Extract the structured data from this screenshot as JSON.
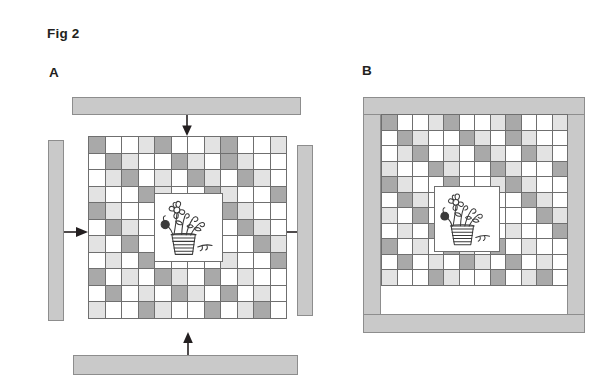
{
  "figure": {
    "title": "Fig 2",
    "panels": [
      {
        "id": "A",
        "label": "A"
      },
      {
        "id": "B",
        "label": "B"
      }
    ]
  },
  "colors": {
    "cell_white": "#ffffff",
    "cell_light": "#e3e3e3",
    "cell_dark": "#a9a9a9",
    "bar_fill": "#c9c9c9",
    "bar_stroke": "#8d8d8d",
    "grid_line": "#6f6f6f",
    "ink": "#231f20"
  },
  "panel_a": {
    "label": "A",
    "grid": {
      "rows": 11,
      "cols": 12,
      "cell_px": 16.5,
      "legend": {
        "w": "white",
        "l": "light-gray",
        "d": "dark-gray"
      },
      "pattern": [
        [
          "d",
          "w",
          "w",
          "l",
          "d",
          "w",
          "w",
          "l",
          "d",
          "w",
          "w",
          "l"
        ],
        [
          "w",
          "d",
          "l",
          "w",
          "w",
          "d",
          "l",
          "w",
          "d",
          "l",
          "w",
          "w"
        ],
        [
          "w",
          "l",
          "d",
          "w",
          "l",
          "w",
          "d",
          "l",
          "w",
          "d",
          "l",
          "w"
        ],
        [
          "l",
          "w",
          "w",
          "d",
          "l",
          "w",
          "w",
          "d",
          "l",
          "w",
          "w",
          "d"
        ],
        [
          "d",
          "l",
          "w",
          "w",
          "d",
          "w",
          "w",
          "l",
          "d",
          "l",
          "w",
          "w"
        ],
        [
          "w",
          "d",
          "l",
          "w",
          "w",
          "w",
          "w",
          "w",
          "w",
          "d",
          "l",
          "w"
        ],
        [
          "l",
          "w",
          "d",
          "w",
          "w",
          "w",
          "w",
          "w",
          "w",
          "w",
          "d",
          "l"
        ],
        [
          "w",
          "l",
          "w",
          "d",
          "w",
          "w",
          "w",
          "w",
          "l",
          "w",
          "w",
          "d"
        ],
        [
          "d",
          "w",
          "l",
          "w",
          "d",
          "l",
          "w",
          "d",
          "w",
          "l",
          "w",
          "w"
        ],
        [
          "w",
          "d",
          "w",
          "l",
          "w",
          "d",
          "l",
          "w",
          "d",
          "w",
          "l",
          "w"
        ],
        [
          "l",
          "w",
          "w",
          "d",
          "l",
          "w",
          "w",
          "d",
          "w",
          "l",
          "d",
          "w"
        ]
      ]
    },
    "bars": [
      {
        "name": "top-bar",
        "orientation": "horizontal"
      },
      {
        "name": "bottom-bar",
        "orientation": "horizontal"
      },
      {
        "name": "left-bar",
        "orientation": "vertical"
      },
      {
        "name": "right-bar",
        "orientation": "vertical"
      }
    ],
    "arrows": [
      {
        "name": "arrow-down",
        "direction": "down"
      },
      {
        "name": "arrow-up",
        "direction": "up"
      },
      {
        "name": "arrow-right",
        "direction": "right"
      },
      {
        "name": "arrow-left",
        "direction": "left"
      }
    ],
    "picture": {
      "name": "flower-vase-drawing",
      "alt": "line drawing of flowers in a striped vase"
    }
  },
  "panel_b": {
    "label": "B",
    "grid": {
      "rows": 11,
      "cols": 12,
      "cell_px": 15.5,
      "pattern": [
        [
          "d",
          "w",
          "w",
          "l",
          "d",
          "w",
          "w",
          "l",
          "d",
          "w",
          "w",
          "l"
        ],
        [
          "w",
          "d",
          "l",
          "w",
          "w",
          "d",
          "l",
          "w",
          "d",
          "l",
          "w",
          "w"
        ],
        [
          "w",
          "l",
          "d",
          "w",
          "l",
          "w",
          "d",
          "l",
          "w",
          "d",
          "l",
          "w"
        ],
        [
          "l",
          "w",
          "w",
          "d",
          "l",
          "w",
          "w",
          "d",
          "l",
          "w",
          "w",
          "d"
        ],
        [
          "d",
          "l",
          "w",
          "w",
          "d",
          "w",
          "w",
          "l",
          "d",
          "l",
          "w",
          "w"
        ],
        [
          "w",
          "d",
          "l",
          "w",
          "w",
          "w",
          "w",
          "w",
          "w",
          "d",
          "l",
          "w"
        ],
        [
          "l",
          "w",
          "d",
          "w",
          "w",
          "w",
          "w",
          "w",
          "w",
          "w",
          "d",
          "l"
        ],
        [
          "w",
          "l",
          "w",
          "d",
          "w",
          "w",
          "w",
          "w",
          "l",
          "w",
          "w",
          "d"
        ],
        [
          "d",
          "w",
          "l",
          "w",
          "d",
          "l",
          "w",
          "d",
          "w",
          "l",
          "w",
          "w"
        ],
        [
          "w",
          "d",
          "w",
          "l",
          "w",
          "d",
          "l",
          "w",
          "d",
          "w",
          "l",
          "w"
        ],
        [
          "l",
          "w",
          "w",
          "d",
          "l",
          "w",
          "w",
          "d",
          "w",
          "l",
          "d",
          "w"
        ]
      ]
    },
    "frame": {
      "name": "compressed-frame",
      "description": "bars pressed against all four sides"
    },
    "picture": {
      "name": "flower-vase-drawing",
      "alt": "line drawing of flowers in a striped vase"
    }
  }
}
